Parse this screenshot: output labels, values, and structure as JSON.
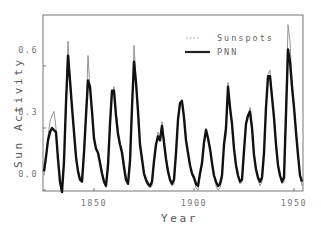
{
  "chart_data": {
    "type": "line",
    "title": "",
    "xlabel": "Year",
    "ylabel": "Sun Activity",
    "xlim": [
      1824.5,
      1954.5
    ],
    "ylim": [
      -0.005,
      0.85
    ],
    "xticks": [
      1850,
      1900,
      1950
    ],
    "xtick_labels": [
      "1850",
      "1900",
      "1950"
    ],
    "yticks": [
      0.0,
      0.3,
      0.6
    ],
    "ytick_labels": [
      "0.0",
      "0.3",
      "0.6"
    ],
    "grid": false,
    "legend_position": "upper right",
    "series": [
      {
        "name": "Sunspots",
        "style": "thin-gray",
        "color": "#888888",
        "x": [
          1825,
          1826,
          1827,
          1828,
          1829,
          1830,
          1831,
          1832,
          1833,
          1834,
          1835,
          1836,
          1837,
          1838,
          1839,
          1840,
          1841,
          1842,
          1843,
          1844,
          1845,
          1846,
          1847,
          1848,
          1849,
          1850,
          1851,
          1852,
          1853,
          1854,
          1855,
          1856,
          1857,
          1858,
          1859,
          1860,
          1861,
          1862,
          1863,
          1864,
          1865,
          1866,
          1867,
          1868,
          1869,
          1870,
          1871,
          1872,
          1873,
          1874,
          1875,
          1876,
          1877,
          1878,
          1879,
          1880,
          1881,
          1882,
          1883,
          1884,
          1885,
          1886,
          1887,
          1888,
          1889,
          1890,
          1891,
          1892,
          1893,
          1894,
          1895,
          1896,
          1897,
          1898,
          1899,
          1900,
          1901,
          1902,
          1903,
          1904,
          1905,
          1906,
          1907,
          1908,
          1909,
          1910,
          1911,
          1912,
          1913,
          1914,
          1915,
          1916,
          1917,
          1918,
          1919,
          1920,
          1921,
          1922,
          1923,
          1924,
          1925,
          1926,
          1927,
          1928,
          1929,
          1930,
          1931,
          1932,
          1933,
          1934,
          1935,
          1936,
          1937,
          1938,
          1939,
          1940,
          1941,
          1942,
          1943,
          1944,
          1945,
          1946,
          1947,
          1948,
          1949,
          1950,
          1951,
          1952,
          1953,
          1954
        ],
        "values": [
          0.07,
          0.15,
          0.26,
          0.33,
          0.36,
          0.38,
          0.3,
          0.14,
          0.05,
          0.02,
          0.12,
          0.42,
          0.72,
          0.55,
          0.4,
          0.28,
          0.14,
          0.1,
          0.06,
          0.05,
          0.2,
          0.38,
          0.65,
          0.48,
          0.38,
          0.26,
          0.2,
          0.18,
          0.14,
          0.09,
          0.05,
          0.02,
          0.1,
          0.3,
          0.46,
          0.5,
          0.38,
          0.3,
          0.22,
          0.2,
          0.14,
          0.06,
          0.03,
          0.12,
          0.38,
          0.7,
          0.54,
          0.4,
          0.22,
          0.15,
          0.07,
          0.04,
          0.02,
          0.01,
          0.02,
          0.13,
          0.22,
          0.28,
          0.25,
          0.33,
          0.24,
          0.16,
          0.1,
          0.04,
          0.02,
          0.03,
          0.17,
          0.34,
          0.42,
          0.44,
          0.36,
          0.25,
          0.18,
          0.12,
          0.07,
          0.05,
          0.01,
          0.0,
          0.07,
          0.12,
          0.22,
          0.3,
          0.26,
          0.21,
          0.14,
          0.07,
          0.02,
          0.0,
          0.01,
          0.05,
          0.22,
          0.26,
          0.52,
          0.4,
          0.33,
          0.2,
          0.12,
          0.08,
          0.03,
          0.04,
          0.18,
          0.32,
          0.36,
          0.4,
          0.31,
          0.17,
          0.1,
          0.05,
          0.02,
          0.04,
          0.17,
          0.4,
          0.56,
          0.58,
          0.46,
          0.36,
          0.23,
          0.12,
          0.08,
          0.03,
          0.04,
          0.38,
          0.8,
          0.72,
          0.52,
          0.42,
          0.29,
          0.18,
          0.07,
          0.02
        ]
      },
      {
        "name": "PNN",
        "style": "thick-black",
        "color": "#111111",
        "x": [
          1825,
          1826,
          1827,
          1828,
          1829,
          1830,
          1831,
          1832,
          1833,
          1834,
          1835,
          1836,
          1837,
          1838,
          1839,
          1840,
          1841,
          1842,
          1843,
          1844,
          1845,
          1846,
          1847,
          1848,
          1849,
          1850,
          1851,
          1852,
          1853,
          1854,
          1855,
          1856,
          1857,
          1858,
          1859,
          1860,
          1861,
          1862,
          1863,
          1864,
          1865,
          1866,
          1867,
          1868,
          1869,
          1870,
          1871,
          1872,
          1873,
          1874,
          1875,
          1876,
          1877,
          1878,
          1879,
          1880,
          1881,
          1882,
          1883,
          1884,
          1885,
          1886,
          1887,
          1888,
          1889,
          1890,
          1891,
          1892,
          1893,
          1894,
          1895,
          1896,
          1897,
          1898,
          1899,
          1900,
          1901,
          1902,
          1903,
          1904,
          1905,
          1906,
          1907,
          1908,
          1909,
          1910,
          1911,
          1912,
          1913,
          1914,
          1915,
          1916,
          1917,
          1918,
          1919,
          1920,
          1921,
          1922,
          1923,
          1924,
          1925,
          1926,
          1927,
          1928,
          1929,
          1930,
          1931,
          1932,
          1933,
          1934,
          1935,
          1936,
          1937,
          1938,
          1939,
          1940,
          1941,
          1942,
          1943,
          1944,
          1945,
          1946,
          1947,
          1948,
          1949,
          1950,
          1951,
          1952,
          1953,
          1954
        ],
        "values": [
          0.09,
          0.16,
          0.24,
          0.28,
          0.3,
          0.29,
          0.28,
          0.15,
          0.04,
          -0.01,
          0.14,
          0.42,
          0.65,
          0.53,
          0.4,
          0.28,
          0.16,
          0.09,
          0.05,
          0.04,
          0.18,
          0.36,
          0.53,
          0.5,
          0.38,
          0.25,
          0.2,
          0.18,
          0.13,
          0.08,
          0.04,
          0.02,
          0.12,
          0.32,
          0.48,
          0.48,
          0.36,
          0.27,
          0.22,
          0.18,
          0.11,
          0.05,
          0.03,
          0.14,
          0.4,
          0.62,
          0.52,
          0.38,
          0.22,
          0.15,
          0.08,
          0.05,
          0.03,
          0.02,
          0.04,
          0.14,
          0.22,
          0.26,
          0.24,
          0.31,
          0.23,
          0.15,
          0.09,
          0.05,
          0.03,
          0.05,
          0.18,
          0.34,
          0.42,
          0.43,
          0.35,
          0.24,
          0.18,
          0.12,
          0.08,
          0.06,
          0.03,
          0.02,
          0.08,
          0.13,
          0.23,
          0.29,
          0.25,
          0.2,
          0.13,
          0.07,
          0.04,
          0.02,
          0.03,
          0.07,
          0.22,
          0.3,
          0.5,
          0.4,
          0.32,
          0.2,
          0.12,
          0.07,
          0.04,
          0.05,
          0.19,
          0.32,
          0.36,
          0.38,
          0.3,
          0.17,
          0.1,
          0.06,
          0.04,
          0.06,
          0.18,
          0.4,
          0.55,
          0.55,
          0.45,
          0.35,
          0.22,
          0.12,
          0.07,
          0.04,
          0.06,
          0.37,
          0.68,
          0.62,
          0.5,
          0.4,
          0.28,
          0.17,
          0.07,
          0.04
        ]
      }
    ]
  },
  "legend": {
    "items": [
      {
        "label": "Sunspots",
        "style": "thin-gray"
      },
      {
        "label": "PNN",
        "style": "thick-black"
      }
    ]
  },
  "axes": {
    "xlabel": "Year",
    "ylabel": "Sun Activity"
  },
  "colors": {
    "background": "#ffffff",
    "frame": "#777777",
    "sunspots": "#888888",
    "pnn": "#111111"
  }
}
